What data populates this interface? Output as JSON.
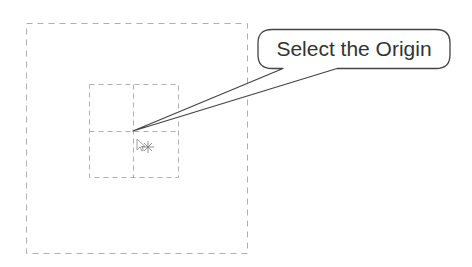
{
  "canvas": {
    "background": "#ffffff",
    "outer_boundary": {
      "x": 26,
      "y": 23,
      "width": 221,
      "height": 230,
      "stroke": "#b0b0b0",
      "style": "dashed"
    },
    "inner_grid": {
      "x": 89,
      "y": 84,
      "width": 89,
      "height": 93,
      "stroke": "#b0b0b0",
      "style": "dashed",
      "center_x": 133,
      "center_y": 131
    }
  },
  "origin_point": {
    "x": 133,
    "y": 131
  },
  "callout": {
    "text": "Select the Origin",
    "box": {
      "x": 258,
      "y": 29,
      "width": 192,
      "height": 40,
      "radius": 14
    },
    "stroke": "#444444",
    "text_color": "#333333"
  },
  "cursor": {
    "icon": "select-cursor-icon",
    "x": 137,
    "y": 139
  }
}
